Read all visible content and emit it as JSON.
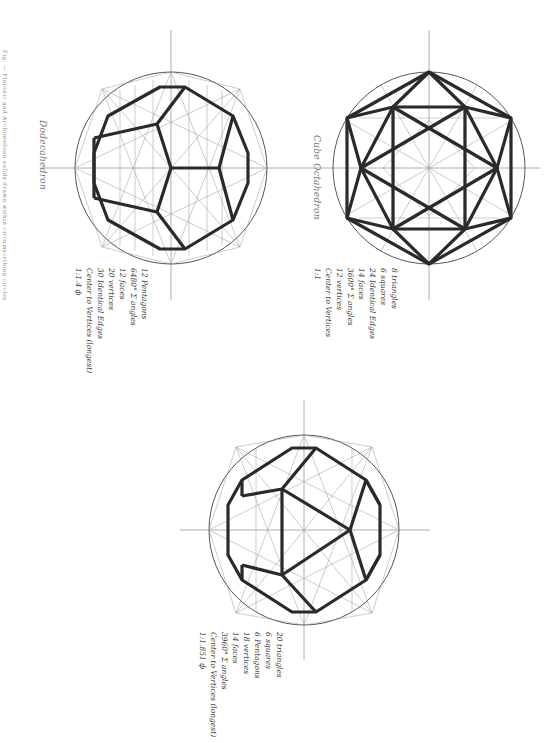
{
  "caption": "Fig. — Platonic and Archimedean solids drawn within circumscribing circles",
  "figures": [
    {
      "name": "Dodecahedron",
      "label": "Dodecahedron",
      "center": [
        171,
        168
      ],
      "radius": 96,
      "properties": [
        "12 Pentagons",
        "6480° Σ angles",
        "12 faces",
        "20 vertices",
        "30 Identical Edges",
        "Center to Vertices (longest)",
        "1:1.4 ф"
      ]
    },
    {
      "name": "Cube Octahedron",
      "label": "Cube Octahedron",
      "center": [
        429,
        168
      ],
      "radius": 96,
      "properties": [
        "8 triangles",
        "6 squares",
        "24 Identical Edges",
        "14 faces",
        "3600° Σ angles",
        "12 vertices",
        "Center to Vertices",
        "1:1"
      ]
    },
    {
      "name": "Icosidodecahedron",
      "label": "",
      "center": [
        304,
        530
      ],
      "radius": 95,
      "properties": [
        "20 triangles",
        "6 squares",
        "6 Pentagons",
        "18 vertices",
        "14 faces",
        "3960° Σ angles",
        "Center to Vertices (longest)",
        "1:1.851 ф"
      ]
    }
  ],
  "colors": {
    "paper": "#ffffff",
    "construction_line": "#8a8a8a",
    "edge": "#2a2a2a",
    "ink": "#3a3a3a"
  }
}
